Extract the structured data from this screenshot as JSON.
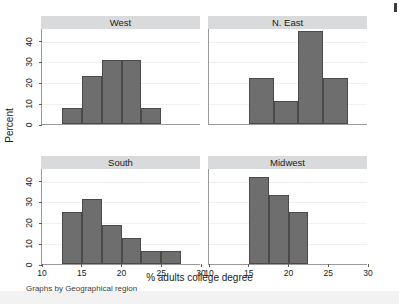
{
  "figure": {
    "xlabel": "% adults college degree",
    "ylabel": "Percent",
    "note": "Graphs by Geographical region"
  },
  "axis": {
    "x_ticks": [
      "10",
      "15",
      "20",
      "25",
      "30"
    ],
    "y_ticks": [
      "0",
      "10",
      "20",
      "30",
      "40"
    ]
  },
  "colors": {
    "bar_fill": "#6e6e6e",
    "bar_stroke": "#4a4a4a",
    "panel_title_bg": "#d9dadb",
    "axis": "#9a9a9a",
    "background": "#ffffff"
  },
  "panels": [
    {
      "title": "West"
    },
    {
      "title": "N. East"
    },
    {
      "title": "South"
    },
    {
      "title": "Midwest"
    }
  ],
  "chart_data": {
    "type": "bar",
    "title": "",
    "subtitle": "Graphs by Geographical region",
    "xlabel": "% adults college degree",
    "ylabel": "Percent",
    "xlim": [
      10,
      30
    ],
    "ylim": [
      0,
      46
    ],
    "x_ticks": [
      10,
      15,
      20,
      25,
      30
    ],
    "y_ticks": [
      0,
      10,
      20,
      30,
      40
    ],
    "grid": true,
    "legend": "none",
    "facet_layout": "2x2",
    "facet_variable": "Geographical region",
    "panels": [
      {
        "name": "West",
        "position": "top-left",
        "bin_width": 2.5,
        "bins": [
          {
            "x0": 12.5,
            "x1": 15.0,
            "percent": 7.7
          },
          {
            "x0": 15.0,
            "x1": 17.5,
            "percent": 23.1
          },
          {
            "x0": 17.5,
            "x1": 20.0,
            "percent": 30.8
          },
          {
            "x0": 20.0,
            "x1": 22.5,
            "percent": 30.8
          },
          {
            "x0": 22.5,
            "x1": 25.0,
            "percent": 7.7
          }
        ]
      },
      {
        "name": "N. East",
        "position": "top-right",
        "bin_width": 3.125,
        "bins": [
          {
            "x0": 15.0,
            "x1": 18.125,
            "percent": 22.2
          },
          {
            "x0": 18.125,
            "x1": 21.25,
            "percent": 11.1
          },
          {
            "x0": 21.25,
            "x1": 24.375,
            "percent": 44.4
          },
          {
            "x0": 24.375,
            "x1": 27.5,
            "percent": 22.2
          }
        ]
      },
      {
        "name": "South",
        "position": "bottom-left",
        "bin_width": 2.5,
        "bins": [
          {
            "x0": 12.5,
            "x1": 15.0,
            "percent": 25.0
          },
          {
            "x0": 15.0,
            "x1": 17.5,
            "percent": 31.3
          },
          {
            "x0": 17.5,
            "x1": 20.0,
            "percent": 18.8
          },
          {
            "x0": 20.0,
            "x1": 22.5,
            "percent": 12.5
          },
          {
            "x0": 22.5,
            "x1": 25.0,
            "percent": 6.3
          },
          {
            "x0": 25.0,
            "x1": 27.5,
            "percent": 6.3
          }
        ]
      },
      {
        "name": "Midwest",
        "position": "bottom-right",
        "bin_width": 2.5,
        "bins": [
          {
            "x0": 15.0,
            "x1": 17.5,
            "percent": 41.7
          },
          {
            "x0": 17.5,
            "x1": 20.0,
            "percent": 33.3
          },
          {
            "x0": 20.0,
            "x1": 22.5,
            "percent": 25.0
          }
        ]
      }
    ]
  }
}
